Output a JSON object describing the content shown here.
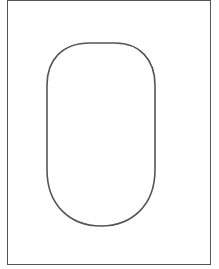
{
  "diagram": {
    "frame": {
      "stroke": "#555555"
    },
    "shape": {
      "type": "rounded-rectangle",
      "stroke": "#555555",
      "fill": "#ffffff"
    }
  }
}
